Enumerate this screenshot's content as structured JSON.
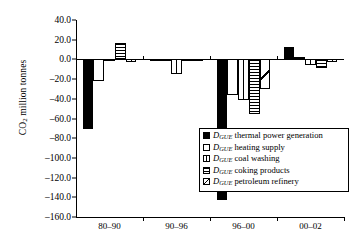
{
  "chart_data": {
    "type": "bar",
    "title": "",
    "xlabel": "",
    "ylabel": "CO2 million tonnes",
    "ylabel_prefix": "CO",
    "ylabel_sub": "2",
    "ylabel_suffix": " million tonnes",
    "categories": [
      "80–90",
      "90–96",
      "96–00",
      "00–02"
    ],
    "ylim": [
      -160.0,
      40.0
    ],
    "yticks": [
      40.0,
      20.0,
      0.0,
      -20.0,
      -40.0,
      -60.0,
      -80.0,
      -100.0,
      -120.0,
      -140.0,
      -160.0
    ],
    "ytick_labels": [
      "40.0",
      "20.0",
      "0.0",
      "–20.0",
      "–40.0",
      "–60.0",
      "–80.0",
      "–100.0",
      "–120.0",
      "–140.0",
      "–160.0"
    ],
    "grid": false,
    "legend_position": "inside-lower-right",
    "series": [
      {
        "name": "D_GUE thermal power generation",
        "pattern": "solid",
        "values": [
          -70.5,
          -1.5,
          -143.0,
          13.0
        ]
      },
      {
        "name": "D_GUE heating supply",
        "pattern": "empty",
        "values": [
          -22.0,
          -0.8,
          -36.0,
          2.5
        ]
      },
      {
        "name": "D_GUE coal washing",
        "pattern": "vsplit",
        "values": [
          -0.5,
          -14.5,
          -41.0,
          -5.5
        ]
      },
      {
        "name": "D_GUE coking products",
        "pattern": "hlines",
        "values": [
          17.0,
          -1.0,
          -55.5,
          -9.0
        ]
      },
      {
        "name": "D_GUE petroleum refinery",
        "pattern": "diag",
        "values": [
          -3.0,
          -1.5,
          -30.5,
          -2.5
        ]
      }
    ]
  },
  "legend": {
    "items": [
      {
        "prefix": "D",
        "sub": "GUE",
        "label": " thermal power generation",
        "pattern": "solid"
      },
      {
        "prefix": "D",
        "sub": "GUE",
        "label": " heating supply",
        "pattern": "empty"
      },
      {
        "prefix": "D",
        "sub": "GUE",
        "label": " coal washing",
        "pattern": "vsplit"
      },
      {
        "prefix": "D",
        "sub": "GUE",
        "label": " coking products",
        "pattern": "hlines"
      },
      {
        "prefix": "D",
        "sub": "GUE",
        "label": " petroleum refinery",
        "pattern": "diag"
      }
    ]
  }
}
